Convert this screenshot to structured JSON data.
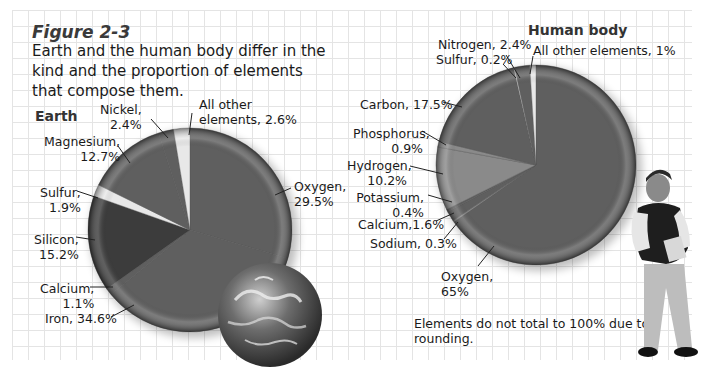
{
  "figure": {
    "label": "Figure 2-3",
    "caption": "Earth and the human body differ in the kind and the proportion of elements that compose them.",
    "note": "Elements do not total to 100% due to rounding."
  },
  "colors": {
    "grid": "#e4e4e4",
    "slice_dark": "#3c3c3c",
    "slice_mid": "#5f5f5f",
    "slice_light": "#8a8a8a",
    "slice_pale": "#e8e8e8"
  },
  "chart_data": [
    {
      "type": "pie",
      "title": "Earth",
      "categories": [
        "Oxygen",
        "Iron",
        "Calcium",
        "Silicon",
        "Sulfur",
        "Magnesium",
        "Nickel",
        "All other elements"
      ],
      "values": [
        29.5,
        34.6,
        1.1,
        15.2,
        1.9,
        12.7,
        2.4,
        2.6
      ],
      "labels": [
        "Oxygen, 29.5%",
        "Iron, 34.6%",
        "Calcium, 1.1%",
        "Silicon, 15.2%",
        "Sulfur, 1.9%",
        "Magnesium, 12.7%",
        "Nickel, 2.4%",
        "All other elements, 2.6%"
      ],
      "start_angle_deg": 0,
      "direction": "clockwise from 12 o'clock",
      "legend": "none (callout labels)"
    },
    {
      "type": "pie",
      "title": "Human body",
      "categories": [
        "Oxygen",
        "Sodium",
        "Calcium",
        "Potassium",
        "Hydrogen",
        "Phosphorus",
        "Carbon",
        "Sulfur",
        "Nitrogen",
        "All other elements"
      ],
      "values": [
        65,
        0.3,
        1.6,
        0.4,
        10.2,
        0.9,
        17.5,
        0.2,
        2.4,
        1
      ],
      "labels": [
        "Oxygen, 65%",
        "Sodium, 0.3%",
        "Calcium,1.6%",
        "Potassium, 0.4%",
        "Hydrogen, 10.2%",
        "Phosphorus, 0.9%",
        "Carbon, 17.5%",
        "Sulfur, 0.2%",
        "Nitrogen, 2.4%",
        "All other elements, 1%"
      ],
      "start_angle_deg": 0,
      "direction": "clockwise from 12 o'clock",
      "legend": "none (callout labels)"
    }
  ],
  "earth_labels": {
    "title": "Earth",
    "nickel": [
      "Nickel,",
      "2.4%"
    ],
    "other": [
      "All other",
      "elements, 2.6%"
    ],
    "magnesium": [
      "Magnesium,",
      "12.7%"
    ],
    "sulfur": [
      "Sulfur,",
      "1.9%"
    ],
    "silicon": [
      "Silicon,",
      "15.2%"
    ],
    "calcium": [
      "Calcium,",
      "1.1%"
    ],
    "iron": "Iron, 34.6%",
    "oxygen": [
      "Oxygen,",
      "29.5%"
    ]
  },
  "body_labels": {
    "title": "Human body",
    "nitrogen": "Nitrogen, 2.4%",
    "sulfur": "Sulfur, 0.2%",
    "other": "All other elements, 1%",
    "carbon": "Carbon, 17.5%",
    "phosphorus": [
      "Phosphorus,",
      "0.9%"
    ],
    "hydrogen": [
      "Hydrogen,",
      "10.2%"
    ],
    "potassium": [
      "Potassium,",
      "0.4%"
    ],
    "calcium": "Calcium,1.6%",
    "sodium": "Sodium, 0.3%",
    "oxygen": [
      "Oxygen,",
      "65%"
    ]
  }
}
